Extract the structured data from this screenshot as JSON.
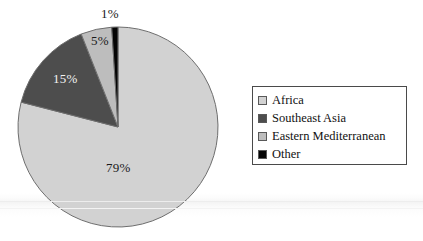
{
  "chart_data": {
    "type": "pie",
    "title": "",
    "subtitle": "",
    "xlabel": "",
    "ylabel": "",
    "grid": false,
    "legend_position": "right",
    "start_angle_deg": 0,
    "direction": "clockwise",
    "categories": [
      "Africa",
      "Southeast Asia",
      "Eastern Mediterranean",
      "Other"
    ],
    "values": [
      79,
      15,
      5,
      1
    ],
    "value_unit": "%",
    "data_labels": [
      "79%",
      "15%",
      "5%",
      "1%"
    ],
    "colors": [
      "#d2d2d2",
      "#4d4d4d",
      "#bdbdbd",
      "#050505"
    ],
    "slices": [
      {
        "name": "Africa",
        "value": 79,
        "label": "79%",
        "color": "#d2d2d2",
        "label_color": "dark"
      },
      {
        "name": "Southeast Asia",
        "value": 15,
        "label": "15%",
        "color": "#4d4d4d",
        "label_color": "light"
      },
      {
        "name": "Eastern Mediterranean",
        "value": 5,
        "label": "5%",
        "color": "#bdbdbd",
        "label_color": "dark"
      },
      {
        "name": "Other",
        "value": 1,
        "label": "1%",
        "color": "#050505",
        "label_color": "dark"
      }
    ]
  },
  "pie": {
    "center_x": 118,
    "center_y": 127,
    "radius": 100,
    "outline_color": "#6e6e6e",
    "labels": {
      "africa": "79%",
      "southeast_asia": "15%",
      "eastern_mediterranean": "5%",
      "other": "1%"
    }
  },
  "legend": {
    "border_color": "#4a4a4a",
    "background": "#ffffff",
    "items": [
      {
        "label": "Africa",
        "color": "#d2d2d2"
      },
      {
        "label": "Southeast Asia",
        "color": "#4d4d4d"
      },
      {
        "label": "Eastern Mediterranean",
        "color": "#bdbdbd"
      },
      {
        "label": "Other",
        "color": "#050505"
      }
    ]
  },
  "canvas": {
    "width": 423,
    "height": 241,
    "background": "#ffffff"
  }
}
